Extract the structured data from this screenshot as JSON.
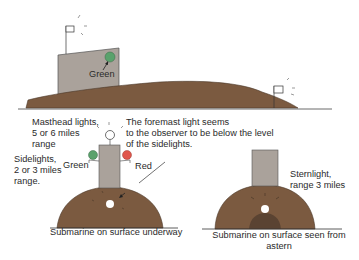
{
  "colors": {
    "hull_brown": "#7b5a40",
    "hull_dark": "#5a4332",
    "tower_gray": "#aaa29b",
    "green_light": "#5aa26c",
    "red_light": "#e0564c",
    "line": "#333333",
    "white_light": "#ffffff"
  },
  "side_view": {
    "green_label": "Green"
  },
  "bow_view": {
    "masthead_label": "Masthead lights,\n5 or 6 miles\nrange",
    "foremast_note": "The foremast light seems\nto the observer to be below the level\nof the sidelights.",
    "sidelights_label": "Sidelights,\n2 or 3 miles\nrange.",
    "green_label": "Green",
    "red_label": "Red",
    "caption": "Submarine on surface underway"
  },
  "stern_view": {
    "sternlight_label": "Sternlight,\nrange 3 miles",
    "caption": "Submarine on surface seen from\nastern"
  }
}
